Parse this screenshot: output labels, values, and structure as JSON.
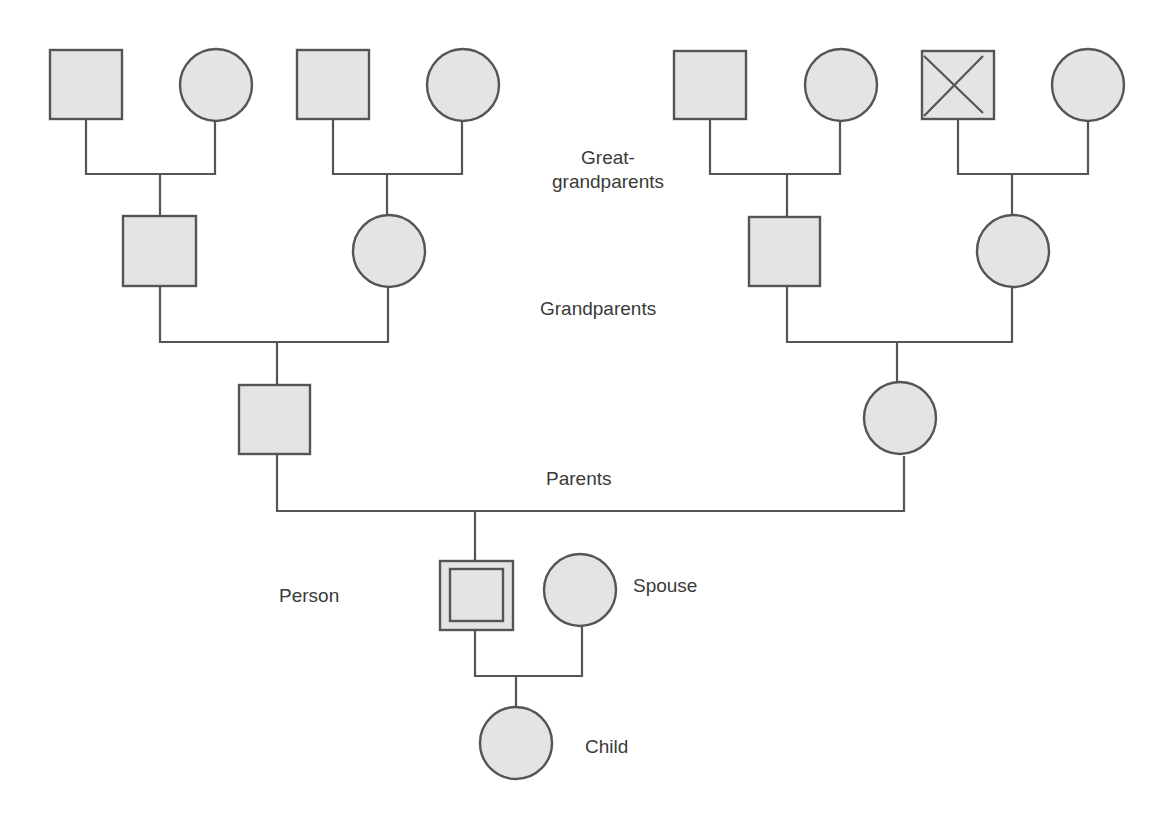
{
  "diagram": {
    "type": "pedigree chart / family tree",
    "colors": {
      "line": "#555555",
      "fill": "#e4e4e4",
      "text": "#3a3a3a",
      "background": "#ffffff"
    },
    "labels": {
      "great_grandparents_line1": "Great-",
      "great_grandparents_line2": "grandparents",
      "grandparents": "Grandparents",
      "parents": "Parents",
      "person": "Person",
      "spouse": "Spouse",
      "child": "Child"
    },
    "generations": [
      {
        "name": "Great-grandparents",
        "members": [
          {
            "sex": "male",
            "shape": "square"
          },
          {
            "sex": "female",
            "shape": "circle"
          },
          {
            "sex": "male",
            "shape": "square"
          },
          {
            "sex": "female",
            "shape": "circle"
          },
          {
            "sex": "male",
            "shape": "square"
          },
          {
            "sex": "female",
            "shape": "circle"
          },
          {
            "sex": "male",
            "shape": "square",
            "marker": "deceased (X)"
          },
          {
            "sex": "female",
            "shape": "circle"
          }
        ]
      },
      {
        "name": "Grandparents",
        "members": [
          {
            "sex": "male",
            "shape": "square"
          },
          {
            "sex": "female",
            "shape": "circle"
          },
          {
            "sex": "male",
            "shape": "square"
          },
          {
            "sex": "female",
            "shape": "circle"
          }
        ]
      },
      {
        "name": "Parents",
        "members": [
          {
            "sex": "male",
            "shape": "square"
          },
          {
            "sex": "female",
            "shape": "circle"
          }
        ]
      },
      {
        "name": "Person",
        "members": [
          {
            "sex": "male",
            "shape": "double square",
            "role": "proband"
          },
          {
            "sex": "female",
            "shape": "circle",
            "role": "spouse"
          }
        ]
      },
      {
        "name": "Child",
        "members": [
          {
            "sex": "female",
            "shape": "circle"
          }
        ]
      }
    ]
  }
}
